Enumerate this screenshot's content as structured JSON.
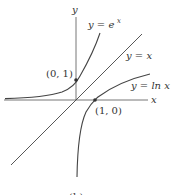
{
  "figure": {
    "caption": "(b)",
    "axes": {
      "x_label": "x",
      "y_label": "y"
    },
    "curves": [
      {
        "name": "exp",
        "label": "y = e^x",
        "label_main": "y = e",
        "label_sup": "x"
      },
      {
        "name": "identity",
        "label": "y = x"
      },
      {
        "name": "log",
        "label": "y = ln x"
      }
    ],
    "points": [
      {
        "label": "(0, 1)"
      },
      {
        "label": "(1, 0)"
      }
    ],
    "colors": {
      "curve": "#333333",
      "axis": "#555555"
    }
  }
}
